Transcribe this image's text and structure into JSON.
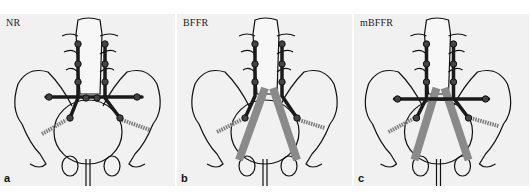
{
  "figure": {
    "panels": [
      {
        "letter": "a",
        "title": "NR",
        "construct": "transverse bar + bilateral sacroiliac rods, no triangular struts"
      },
      {
        "letter": "b",
        "title": "BFFR",
        "construct": "bilateral rods with triangular struts to pubis, no transverse bar"
      },
      {
        "letter": "c",
        "title": "mBFFR",
        "construct": "transverse bar + bilateral rods + triangular struts"
      }
    ],
    "colors": {
      "panel_bg": "#f1f1f1",
      "bone_outline": "#111111",
      "rod": "#1a1a1a",
      "strut": "#8a8a8a",
      "screw": "#7a7a7a"
    }
  }
}
